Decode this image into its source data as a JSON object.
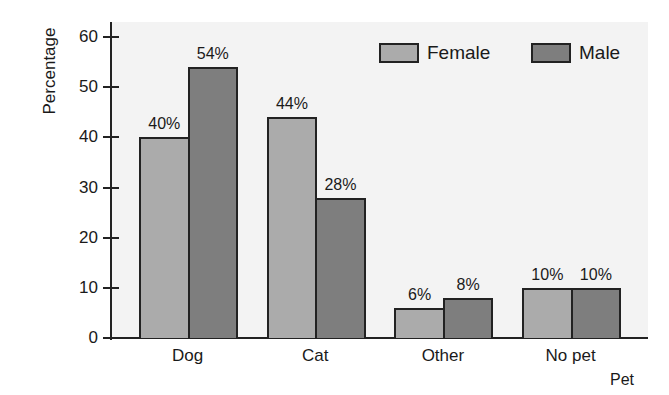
{
  "chart_data": {
    "type": "bar",
    "title": "",
    "xlabel": "Pet",
    "ylabel": "Percentage",
    "ylim": [
      0,
      60
    ],
    "yticks": [
      0,
      10,
      20,
      30,
      40,
      50,
      60
    ],
    "grid": false,
    "legend_position": "top-right",
    "categories": [
      "Dog",
      "Cat",
      "Other",
      "No pet"
    ],
    "series": [
      {
        "name": "Female",
        "color": "#ababab",
        "values": [
          40,
          44,
          6,
          10
        ],
        "labels": [
          "40%",
          "44%",
          "6%",
          "10%"
        ]
      },
      {
        "name": "Male",
        "color": "#7e7e7e",
        "values": [
          54,
          28,
          8,
          10
        ],
        "labels": [
          "54%",
          "28%",
          "8%",
          "10%"
        ]
      }
    ]
  }
}
